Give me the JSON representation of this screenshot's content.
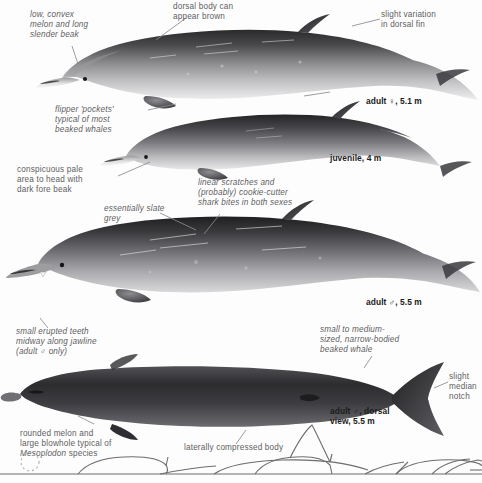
{
  "plate": {
    "title": "Beaked whale identification plate",
    "subject": "Mesoplodon beaked whale",
    "background": "#ffffff",
    "ink": "#58585a"
  },
  "annotations": [
    {
      "id": "melon-beak",
      "text": "low, convex\nmelon and long\nslender beak",
      "style": "italic",
      "align": "left",
      "x": 30,
      "y": 10,
      "w": 84
    },
    {
      "id": "dorsal-brown",
      "text": "dorsal body can\nappear brown",
      "style": "upright",
      "align": "left",
      "x": 173,
      "y": 2,
      "w": 92
    },
    {
      "id": "dorsal-fin-variation",
      "text": "slight variation\nin dorsal fin",
      "style": "upright",
      "align": "left",
      "x": 381,
      "y": 10,
      "w": 90
    },
    {
      "id": "flipper-pockets",
      "text": "flipper 'pockets'\ntypical of most\nbeaked whales",
      "style": "italic",
      "align": "left",
      "x": 55,
      "y": 105,
      "w": 92
    },
    {
      "id": "pale-head",
      "text": "conspicuous pale\narea to head with\ndark fore beak",
      "style": "upright",
      "align": "left",
      "x": 17,
      "y": 165,
      "w": 100
    },
    {
      "id": "scratches-bites",
      "text": "linear scratches and\n(probably) cookie-cutter\nshark bites in both sexes",
      "style": "italic",
      "align": "left",
      "x": 198,
      "y": 178,
      "w": 124
    },
    {
      "id": "slate-grey",
      "text": "essentially slate\ngrey",
      "style": "italic",
      "align": "left",
      "x": 104,
      "y": 204,
      "w": 84
    },
    {
      "id": "erupted-teeth",
      "text": "small erupted teeth\nmidway along jawline\n(adult ♂ only)",
      "style": "italic",
      "align": "left",
      "x": 16,
      "y": 327,
      "w": 116
    },
    {
      "id": "body-shape",
      "text": "small to medium-\nsized, narrow-bodied\nbeaked whale",
      "style": "italic",
      "align": "left",
      "x": 320,
      "y": 325,
      "w": 118
    },
    {
      "id": "median-notch",
      "text": "slight\nmedian\nnotch",
      "style": "upright",
      "align": "left",
      "x": 449,
      "y": 372,
      "w": 34
    },
    {
      "id": "rounded-melon",
      "text": "rounded melon and\nlarge blowhole typical of",
      "text_italic_tail": "Mesoplodon",
      "text_tail": " species",
      "style": "upright",
      "align": "left",
      "x": 20,
      "y": 429,
      "w": 120
    },
    {
      "id": "laterally-compressed",
      "text": "laterally compressed body",
      "style": "upright",
      "align": "left",
      "x": 184,
      "y": 443,
      "w": 130
    }
  ],
  "captions": [
    {
      "id": "adult-female",
      "text": "adult ♀, 5.1 m",
      "x": 366,
      "y": 96
    },
    {
      "id": "juvenile",
      "text": "juvenile, 4 m",
      "x": 330,
      "y": 153
    },
    {
      "id": "adult-male",
      "text": "adult ♂, 5.5 m",
      "x": 366,
      "y": 297
    },
    {
      "id": "adult-male-dorsal",
      "text": "adult ♂, dorsal\nview, 5.5 m",
      "x": 330,
      "y": 406
    }
  ],
  "figures": [
    {
      "id": "adult-female-lateral",
      "label": "adult female, lateral view"
    },
    {
      "id": "juvenile-lateral",
      "label": "juvenile, lateral view"
    },
    {
      "id": "adult-male-lateral",
      "label": "adult male, lateral view"
    },
    {
      "id": "adult-male-dorsal-view",
      "label": "adult male, dorsal view"
    },
    {
      "id": "surfacing-sequence",
      "label": "surfacing sequence silhouettes"
    }
  ]
}
